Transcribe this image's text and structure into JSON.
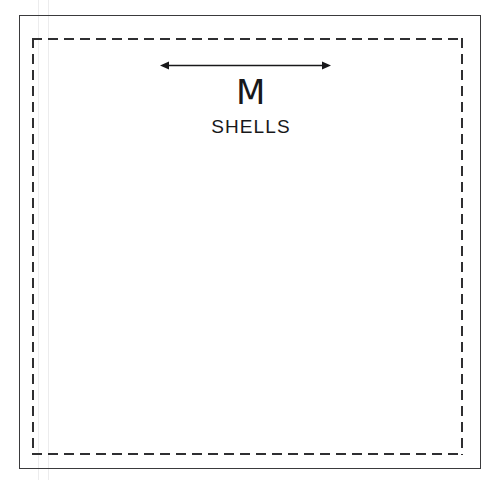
{
  "document": {
    "title": "Packaging Die-Line Template",
    "canvas_width": 502,
    "canvas_height": 480,
    "background_color": "#ffffff"
  },
  "artboard": {
    "trim_border": {
      "name": "trim-line",
      "style": "solid",
      "color": "#3a3a3c",
      "thickness_px": 1
    },
    "safe_border": {
      "name": "safe-area-line",
      "style": "dashed",
      "color": "#2f2f31",
      "thickness_px": 2,
      "dash_px": 10,
      "gap_px": 6
    },
    "guides": [
      {
        "name": "vertical-guide-left",
        "x": 38,
        "color": "#ececed"
      },
      {
        "name": "vertical-guide-right",
        "x": 48,
        "color": "#ececed"
      }
    ]
  },
  "annotations": {
    "width_arrow": {
      "label": "width-dimension-arrow",
      "direction": "double-headed-horizontal",
      "color": "#18181a",
      "x_start": 160,
      "x_end": 331,
      "y": 65
    }
  },
  "brand": {
    "letter": "M",
    "word": "SHELLS",
    "color": "#18181a"
  }
}
